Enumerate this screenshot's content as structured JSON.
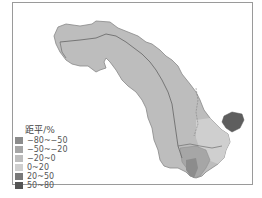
{
  "map": {
    "region": "river basin choropleth (precipitation anomaly)",
    "legend": {
      "title": "距平/%",
      "items": [
        {
          "label": "−80~−50",
          "color": "#8c8c8c"
        },
        {
          "label": "−50~−20",
          "color": "#a6a6a6"
        },
        {
          "label": "−20~0",
          "color": "#bdbdbd"
        },
        {
          "label": "0~20",
          "color": "#cfcfcf"
        },
        {
          "label": "20~50",
          "color": "#7a7a7a"
        },
        {
          "label": "50~80",
          "color": "#555555"
        }
      ]
    },
    "colors": {
      "basin_fill": "#bdbdbd",
      "boundary": "#6e6e6e",
      "highlight_high": "#5e5e5e",
      "frame": "#9a9a9a"
    }
  }
}
